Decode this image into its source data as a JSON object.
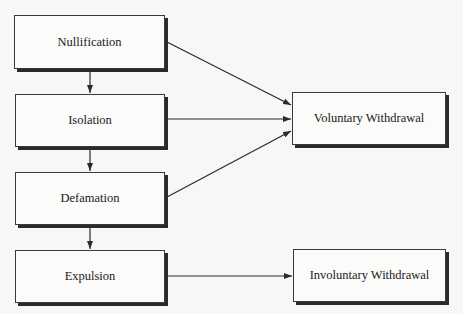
{
  "diagram": {
    "nodes": [
      {
        "id": "nullification",
        "label": "Nullification"
      },
      {
        "id": "isolation",
        "label": "Isolation"
      },
      {
        "id": "defamation",
        "label": "Defamation"
      },
      {
        "id": "expulsion",
        "label": "Expulsion"
      },
      {
        "id": "voluntary",
        "label": "Voluntary Withdrawal"
      },
      {
        "id": "involuntary",
        "label": "Involuntary Withdrawal"
      }
    ],
    "edges": [
      {
        "from": "nullification",
        "to": "isolation"
      },
      {
        "from": "isolation",
        "to": "defamation"
      },
      {
        "from": "defamation",
        "to": "expulsion"
      },
      {
        "from": "nullification",
        "to": "voluntary"
      },
      {
        "from": "isolation",
        "to": "voluntary"
      },
      {
        "from": "defamation",
        "to": "voluntary"
      },
      {
        "from": "expulsion",
        "to": "involuntary"
      }
    ],
    "line_color": "#2a2a2a"
  }
}
